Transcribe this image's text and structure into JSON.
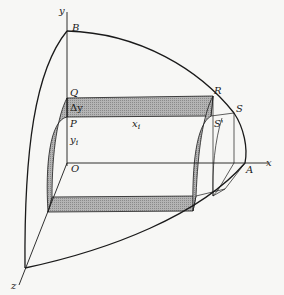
{
  "figure": {
    "type": "3D solid of revolution with cylindrical shell slab",
    "colors": {
      "background": "#f7f7f5",
      "line": "#1a1a1a",
      "shade": "#a9a9a9"
    },
    "labels": {
      "y_axis": "y",
      "x_axis": "x",
      "z_axis": "z",
      "B": "B",
      "Q": "Q",
      "P": "P",
      "O": "O",
      "A": "A",
      "R": "R",
      "S": "S",
      "S_prime": "S'",
      "delta_y": "Δy",
      "x_i": "x",
      "x_i_sub": "i",
      "y_i": "y",
      "y_i_sub": "i"
    }
  }
}
